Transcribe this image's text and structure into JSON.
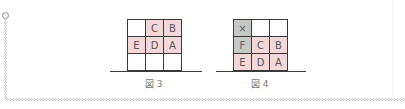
{
  "colors": {
    "highlight_pink": "#f2d8d8",
    "highlight_gray": "#c4c9c6",
    "grid_line": "#3a3a3a",
    "label_text": "#555555"
  },
  "figures": [
    {
      "caption": "図 3",
      "rows": [
        [
          {
            "label": "",
            "fill": "empty"
          },
          {
            "label": "C",
            "fill": "pink"
          },
          {
            "label": "B",
            "fill": "pink"
          }
        ],
        [
          {
            "label": "E",
            "fill": "pink"
          },
          {
            "label": "D",
            "fill": "pink"
          },
          {
            "label": "A",
            "fill": "pink"
          }
        ],
        [
          {
            "label": "",
            "fill": "empty"
          },
          {
            "label": "",
            "fill": "empty"
          },
          {
            "label": "",
            "fill": "empty"
          }
        ]
      ]
    },
    {
      "caption": "図 4",
      "rows": [
        [
          {
            "label": "×",
            "fill": "gray"
          },
          {
            "label": "",
            "fill": "empty"
          },
          {
            "label": "",
            "fill": "empty"
          }
        ],
        [
          {
            "label": "F",
            "fill": "gray"
          },
          {
            "label": "C",
            "fill": "pink"
          },
          {
            "label": "B",
            "fill": "pink"
          }
        ],
        [
          {
            "label": "E",
            "fill": "pink"
          },
          {
            "label": "D",
            "fill": "pink"
          },
          {
            "label": "A",
            "fill": "pink"
          }
        ]
      ]
    }
  ]
}
